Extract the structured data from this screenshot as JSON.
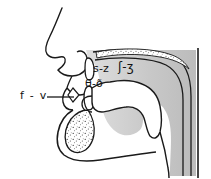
{
  "figure": {
    "background_color": "#ffffff",
    "line_color": "#111111",
    "shading_color": "#c8c8c8",
    "width": 211,
    "height": 179
  },
  "labels": {
    "labiodental": {
      "text": "f - v",
      "place": "labiodental",
      "x": 20,
      "y": 90
    },
    "alveolar": {
      "text": "s-z",
      "place": "alveolar",
      "x": 93,
      "y": 63
    },
    "postalveolar": {
      "text": "ʃ-ʒ",
      "place": "postalveolar",
      "x": 118,
      "y": 61
    },
    "dental": {
      "text": "θ-ð",
      "place": "dental",
      "x": 85,
      "y": 78
    }
  },
  "anatomy": {
    "nose": "nose-profile",
    "upper_lip": "upper-lip",
    "lower_lip": "lower-lip",
    "upper_teeth": "upper-incisor",
    "lower_teeth": "lower-incisor",
    "hard_palate": "hard-palate-stippled",
    "soft_palate": "soft-palate-velum",
    "tongue": "tongue-body",
    "mandible": "mandible-stippled",
    "pharynx": "pharyngeal-cavity",
    "posterior_wall": "posterior-pharyngeal-wall"
  },
  "leader_lines": {
    "labiodental_leader": {
      "from_x": 47,
      "from_y": 97,
      "to_x": 73,
      "to_y": 97
    }
  }
}
